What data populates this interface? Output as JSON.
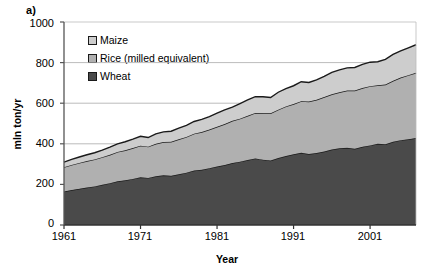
{
  "panel": {
    "label": "a)"
  },
  "chart_data": {
    "type": "area",
    "stacked": true,
    "title": "",
    "xlabel": "Year",
    "ylabel": "mln ton/yr",
    "xlim": [
      1961,
      2007
    ],
    "ylim": [
      0,
      1000
    ],
    "yticks": [
      0,
      200,
      400,
      600,
      800,
      1000
    ],
    "xticks": [
      1961,
      1971,
      1981,
      1991,
      2001
    ],
    "grid": "horizontal",
    "legend_position": "upper-left-inside",
    "colors": {
      "maize": "#cdcdcd",
      "rice": "#b0b0b0",
      "wheat": "#4a4a4a",
      "outline": "#1a1a1a",
      "axis": "#555555",
      "gridline": "#aaaaaa"
    },
    "x": [
      1961,
      1962,
      1963,
      1964,
      1965,
      1966,
      1967,
      1968,
      1969,
      1970,
      1971,
      1972,
      1973,
      1974,
      1975,
      1976,
      1977,
      1978,
      1979,
      1980,
      1981,
      1982,
      1983,
      1984,
      1985,
      1986,
      1987,
      1988,
      1989,
      1990,
      1991,
      1992,
      1993,
      1994,
      1995,
      1996,
      1997,
      1998,
      1999,
      2000,
      2001,
      2002,
      2003,
      2004,
      2005,
      2006,
      2007
    ],
    "series": [
      {
        "name": "Wheat",
        "color": "#4a4a4a",
        "values": [
          165,
          172,
          178,
          185,
          190,
          198,
          206,
          215,
          220,
          227,
          235,
          232,
          240,
          245,
          242,
          250,
          258,
          268,
          272,
          280,
          288,
          295,
          305,
          312,
          320,
          328,
          322,
          318,
          330,
          340,
          348,
          356,
          350,
          355,
          362,
          372,
          378,
          380,
          376,
          385,
          392,
          400,
          398,
          410,
          418,
          422,
          428
        ]
      },
      {
        "name": "Rice (milled equivalent)",
        "color": "#b0b0b0",
        "values": [
          120,
          124,
          128,
          130,
          133,
          136,
          140,
          145,
          148,
          152,
          156,
          154,
          160,
          164,
          168,
          172,
          176,
          182,
          186,
          190,
          196,
          202,
          208,
          212,
          218,
          224,
          228,
          232,
          238,
          244,
          248,
          254,
          258,
          262,
          268,
          272,
          276,
          282,
          286,
          290,
          292,
          288,
          294,
          300,
          308,
          316,
          322
        ]
      },
      {
        "name": "Maize",
        "color": "#cdcdcd",
        "values": [
          25,
          27,
          29,
          31,
          33,
          35,
          38,
          40,
          42,
          44,
          46,
          45,
          49,
          50,
          52,
          55,
          57,
          60,
          62,
          64,
          67,
          70,
          68,
          74,
          78,
          80,
          82,
          78,
          86,
          88,
          90,
          96,
          94,
          98,
          102,
          108,
          110,
          112,
          114,
          116,
          118,
          116,
          124,
          130,
          132,
          135,
          138
        ]
      }
    ]
  },
  "legend": {
    "items": [
      {
        "label": "Maize",
        "color": "#cdcdcd"
      },
      {
        "label": "Rice (milled equivalent)",
        "color": "#b0b0b0"
      },
      {
        "label": "Wheat",
        "color": "#4a4a4a"
      }
    ]
  },
  "axes": {
    "y_title": "mln ton/yr",
    "x_title": "Year",
    "y_tick_labels": [
      "1000",
      "800",
      "600",
      "400",
      "200",
      "0"
    ],
    "x_tick_labels": [
      "1961",
      "1971",
      "1981",
      "1991",
      "2001"
    ]
  }
}
